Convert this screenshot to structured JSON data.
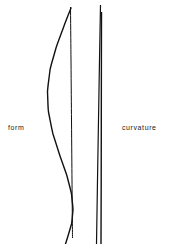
{
  "canvas": {
    "width": 171,
    "height": 244,
    "background_color": "#ffffff",
    "stroke_color": "#111111"
  },
  "panels": [
    {
      "id": "form",
      "label": "form",
      "label_position": {
        "x": 8,
        "y": 124
      },
      "description": "A bowed rod curve crossing a straight vertical reference line"
    },
    {
      "id": "curvature",
      "label": "curvature",
      "label_position": {
        "x": 122,
        "y": 124
      },
      "description": "Two nearly parallel near-vertical lines that converge at the top"
    }
  ],
  "chart_data": {
    "type": "line",
    "title": "",
    "xlabel": "",
    "ylabel": "",
    "grid": false,
    "legend_position": "inline-left-and-right",
    "series": [
      {
        "name": "form-reference-line",
        "panel": "form",
        "stroke": "#111111",
        "width": 1.0,
        "points": [
          {
            "x": 70.5,
            "y": 7
          },
          {
            "x": 71.0,
            "y": 60
          },
          {
            "x": 71.5,
            "y": 120
          },
          {
            "x": 72.0,
            "y": 180
          },
          {
            "x": 72.5,
            "y": 238
          }
        ]
      },
      {
        "name": "form-deflected-curve",
        "panel": "form",
        "stroke": "#111111",
        "width": 1.4,
        "points": [
          {
            "x": 71.0,
            "y": 8
          },
          {
            "x": 64.0,
            "y": 26
          },
          {
            "x": 56.0,
            "y": 48
          },
          {
            "x": 50.0,
            "y": 70
          },
          {
            "x": 47.5,
            "y": 92
          },
          {
            "x": 48.5,
            "y": 112
          },
          {
            "x": 53.0,
            "y": 134
          },
          {
            "x": 60.0,
            "y": 156
          },
          {
            "x": 67.0,
            "y": 176
          },
          {
            "x": 71.5,
            "y": 194
          },
          {
            "x": 73.0,
            "y": 210
          },
          {
            "x": 71.5,
            "y": 224
          },
          {
            "x": 68.0,
            "y": 236
          },
          {
            "x": 65.5,
            "y": 244
          }
        ]
      },
      {
        "name": "curvature-line-left",
        "panel": "curvature",
        "stroke": "#111111",
        "width": 1.2,
        "points": [
          {
            "x": 100.5,
            "y": 5
          },
          {
            "x": 99.5,
            "y": 60
          },
          {
            "x": 98.5,
            "y": 120
          },
          {
            "x": 97.5,
            "y": 180
          },
          {
            "x": 96.5,
            "y": 244
          }
        ]
      },
      {
        "name": "curvature-line-right",
        "panel": "curvature",
        "stroke": "#111111",
        "width": 1.4,
        "points": [
          {
            "x": 101.5,
            "y": 12
          },
          {
            "x": 101.4,
            "y": 60
          },
          {
            "x": 101.3,
            "y": 120
          },
          {
            "x": 101.2,
            "y": 180
          },
          {
            "x": 101.0,
            "y": 244
          }
        ]
      }
    ]
  }
}
